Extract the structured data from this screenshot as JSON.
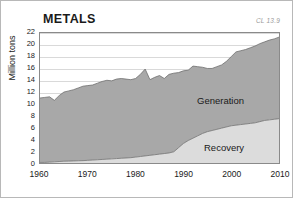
{
  "figure": {
    "title": "METALS",
    "plate_ref": "CL 13.9",
    "ylabel": "Million tons"
  },
  "axes": {
    "y_ticks": [
      "22",
      "20",
      "18",
      "16",
      "14",
      "12",
      "10",
      "8",
      "6",
      "4",
      "2",
      "0"
    ],
    "x_ticks": [
      "1960",
      "1970",
      "1980",
      "1990",
      "2000",
      "2010"
    ]
  },
  "labels": {
    "generation": "Generation",
    "recovery": "Recovery"
  },
  "colors": {
    "generation_fill": "#a8a8a8",
    "recovery_fill": "#dcdcdc",
    "outline": "#6e6e6e",
    "gridline": "#d9d9d9",
    "frame": "#8a8a8a",
    "plate_ref": "#9a9a9a"
  },
  "chart_data": {
    "type": "area",
    "title": "METALS",
    "subtitle": "CL 13.9",
    "xlabel": "",
    "ylabel": "Million tons",
    "xlim": [
      1960,
      2010
    ],
    "ylim": [
      0,
      22
    ],
    "ytick_step": 2,
    "xtick_step": 10,
    "grid": true,
    "stacked": true,
    "legend": "inline-annotations",
    "x": [
      1960,
      1961,
      1962,
      1963,
      1964,
      1965,
      1966,
      1967,
      1968,
      1969,
      1970,
      1971,
      1972,
      1973,
      1974,
      1975,
      1976,
      1977,
      1978,
      1979,
      1980,
      1981,
      1982,
      1983,
      1984,
      1985,
      1986,
      1987,
      1988,
      1989,
      1990,
      1991,
      1992,
      1993,
      1994,
      1995,
      1996,
      1997,
      1998,
      1999,
      2000,
      2001,
      2002,
      2003,
      2004,
      2005,
      2006,
      2007,
      2008,
      2009,
      2010
    ],
    "series": [
      {
        "name": "Generation",
        "values": [
          11.0,
          11.1,
          11.2,
          10.6,
          11.4,
          12.0,
          12.2,
          12.4,
          12.7,
          13.0,
          13.1,
          13.2,
          13.5,
          13.8,
          14.0,
          13.9,
          14.2,
          14.3,
          14.2,
          14.1,
          14.3,
          15.0,
          15.9,
          14.1,
          14.5,
          14.8,
          14.3,
          15.0,
          15.2,
          15.3,
          15.6,
          15.7,
          16.4,
          16.3,
          16.2,
          16.0,
          16.0,
          16.3,
          16.6,
          17.2,
          18.0,
          18.8,
          19.0,
          19.2,
          19.5,
          19.8,
          20.2,
          20.5,
          20.8,
          21.0,
          21.3
        ],
        "note": "Upper boundary of stack = total generation"
      },
      {
        "name": "Recovery",
        "values": [
          0.1,
          0.1,
          0.15,
          0.2,
          0.25,
          0.3,
          0.32,
          0.35,
          0.38,
          0.4,
          0.45,
          0.5,
          0.55,
          0.6,
          0.65,
          0.7,
          0.75,
          0.8,
          0.85,
          0.9,
          1.0,
          1.1,
          1.2,
          1.3,
          1.4,
          1.5,
          1.6,
          1.7,
          1.9,
          2.6,
          3.3,
          3.8,
          4.2,
          4.6,
          5.0,
          5.3,
          5.5,
          5.7,
          5.9,
          6.1,
          6.3,
          6.4,
          6.5,
          6.6,
          6.7,
          6.8,
          7.0,
          7.2,
          7.3,
          7.4,
          7.5
        ],
        "note": "Lower band of stack = metals recovered for recycling"
      }
    ]
  }
}
